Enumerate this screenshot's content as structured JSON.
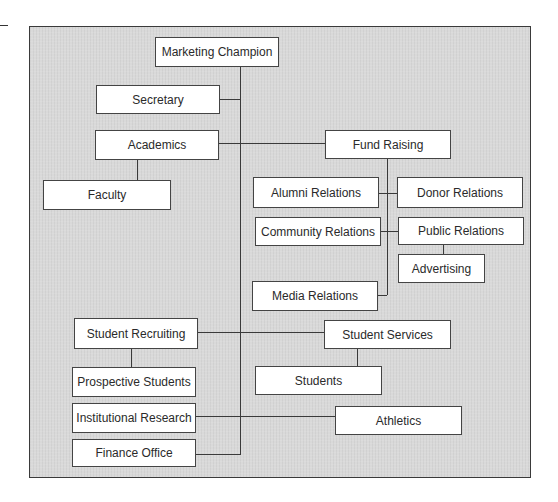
{
  "diagram": {
    "type": "organization-chart",
    "root": "Marketing Champion",
    "nodes": [
      {
        "id": "marketing-champion",
        "label": "Marketing Champion"
      },
      {
        "id": "secretary",
        "label": "Secretary"
      },
      {
        "id": "academics",
        "label": "Academics"
      },
      {
        "id": "faculty",
        "label": "Faculty"
      },
      {
        "id": "fund-raising",
        "label": "Fund Raising"
      },
      {
        "id": "alumni-relations",
        "label": "Alumni Relations"
      },
      {
        "id": "donor-relations",
        "label": "Donor Relations"
      },
      {
        "id": "community-relations",
        "label": "Community Relations"
      },
      {
        "id": "public-relations",
        "label": "Public Relations"
      },
      {
        "id": "advertising",
        "label": "Advertising"
      },
      {
        "id": "media-relations",
        "label": "Media Relations"
      },
      {
        "id": "student-recruiting",
        "label": "Student Recruiting"
      },
      {
        "id": "student-services",
        "label": "Student Services"
      },
      {
        "id": "prospective-students",
        "label": "Prospective Students"
      },
      {
        "id": "students",
        "label": "Students"
      },
      {
        "id": "institutional-research",
        "label": "Institutional Research"
      },
      {
        "id": "athletics",
        "label": "Athletics"
      },
      {
        "id": "finance-office",
        "label": "Finance Office"
      }
    ],
    "edges": [
      [
        "marketing-champion",
        "secretary"
      ],
      [
        "marketing-champion",
        "academics"
      ],
      [
        "marketing-champion",
        "fund-raising"
      ],
      [
        "academics",
        "faculty"
      ],
      [
        "fund-raising",
        "alumni-relations"
      ],
      [
        "fund-raising",
        "donor-relations"
      ],
      [
        "fund-raising",
        "community-relations"
      ],
      [
        "fund-raising",
        "public-relations"
      ],
      [
        "fund-raising",
        "media-relations"
      ],
      [
        "public-relations",
        "advertising"
      ],
      [
        "marketing-champion",
        "student-recruiting"
      ],
      [
        "marketing-champion",
        "student-services"
      ],
      [
        "student-recruiting",
        "prospective-students"
      ],
      [
        "student-services",
        "students"
      ],
      [
        "marketing-champion",
        "institutional-research"
      ],
      [
        "marketing-champion",
        "athletics"
      ],
      [
        "marketing-champion",
        "finance-office"
      ]
    ]
  },
  "labels": {
    "marketing_champion": "Marketing Champion",
    "secretary": "Secretary",
    "academics": "Academics",
    "faculty": "Faculty",
    "fund_raising": "Fund Raising",
    "alumni_relations": "Alumni Relations",
    "donor_relations": "Donor Relations",
    "community_relations": "Community Relations",
    "public_relations": "Public Relations",
    "advertising": "Advertising",
    "media_relations": "Media Relations",
    "student_recruiting": "Student Recruiting",
    "student_services": "Student Services",
    "prospective_students": "Prospective Students",
    "students": "Students",
    "institutional_research": "Institutional Research",
    "athletics": "Athletics",
    "finance_office": "Finance Office"
  },
  "colors": {
    "panel_background": "#d9d9d9",
    "box_background": "#ffffff",
    "line": "#3a3a3a"
  }
}
